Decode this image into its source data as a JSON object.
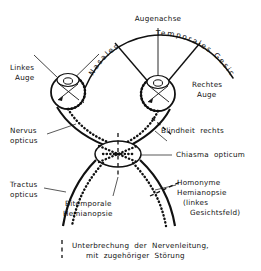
{
  "figure": {
    "language": "de",
    "background_color": "#ffffff",
    "ink_color": "#111111"
  },
  "labels": {
    "augenachse": "Augenachse",
    "nasales": "Nasales",
    "temporales_gesichtsfeld": "Temporales Gesichtsfeld",
    "linkes_auge_line1": "Linkes",
    "linkes_auge_line2": "Auge",
    "rechtes_auge_line1": "Rechtes",
    "rechtes_auge_line2": "Auge",
    "nervus_opticus_line1": "Nervus",
    "nervus_opticus_line2": "opticus",
    "blindheit_rechts": "Blindheit  rechts",
    "chiasma_opticum": "Chiasma  opticum",
    "tractus_opticus_line1": "Tractus",
    "tractus_opticus_line2": "opticus",
    "bitemporale_line1": "Bitemporale",
    "bitemporale_line2": "Hemianopsie",
    "homonyme_line1": "Homonyme",
    "homonyme_line2": "Hemianopsie",
    "homonyme_line3": "(linkes",
    "homonyme_line4": "Gesichtsfeld)"
  },
  "legend": {
    "line1": "Unterbrechung  der  Nervenleitung,",
    "line2": "mit  zugehöriger  Störung",
    "key_style": "vertical-dashed-line"
  }
}
